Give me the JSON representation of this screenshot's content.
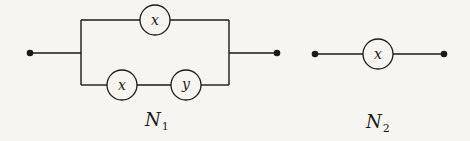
{
  "networks": [
    {
      "name": "N",
      "subscript": "1",
      "description": "parallel network: x in parallel with (x series y)",
      "top_branch": [
        {
          "label": "x"
        }
      ],
      "bottom_branch": [
        {
          "label": "x"
        },
        {
          "label": "y"
        }
      ]
    },
    {
      "name": "N",
      "subscript": "2",
      "description": "single switch x",
      "switches": [
        {
          "label": "x"
        }
      ]
    }
  ]
}
